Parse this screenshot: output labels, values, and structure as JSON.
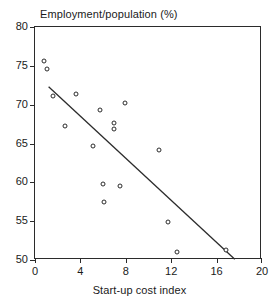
{
  "chart_data": {
    "type": "scatter",
    "title": "",
    "xlabel": "Start-up cost index",
    "ylabel": "Employment/population (%)",
    "xlim": [
      0,
      20
    ],
    "ylim": [
      50,
      80
    ],
    "xticks": [
      0,
      4,
      8,
      12,
      16,
      20
    ],
    "yticks": [
      50,
      55,
      60,
      65,
      70,
      75,
      80
    ],
    "grid": false,
    "legend": false,
    "marker": "open-circle",
    "points": [
      {
        "x": 0.8,
        "y": 75.6
      },
      {
        "x": 1.1,
        "y": 74.6
      },
      {
        "x": 1.6,
        "y": 71.1
      },
      {
        "x": 2.6,
        "y": 67.2
      },
      {
        "x": 3.6,
        "y": 71.4
      },
      {
        "x": 5.1,
        "y": 64.7
      },
      {
        "x": 5.7,
        "y": 69.3
      },
      {
        "x": 6.0,
        "y": 59.8
      },
      {
        "x": 6.1,
        "y": 57.5
      },
      {
        "x": 7.0,
        "y": 67.6
      },
      {
        "x": 7.0,
        "y": 66.9
      },
      {
        "x": 7.5,
        "y": 59.5
      },
      {
        "x": 7.9,
        "y": 70.2
      },
      {
        "x": 10.9,
        "y": 64.1
      },
      {
        "x": 11.7,
        "y": 54.9
      },
      {
        "x": 12.5,
        "y": 51.0
      },
      {
        "x": 16.8,
        "y": 51.3
      }
    ],
    "fit_line": {
      "type": "linear-regression",
      "x0": 1.2,
      "y0": 72.3,
      "x1": 17.6,
      "y1": 50.1
    },
    "colors": {
      "axis": "#2b2b2b",
      "marker": "#2b2b2b",
      "line": "#2b2b2b",
      "background": "#ffffff"
    }
  }
}
